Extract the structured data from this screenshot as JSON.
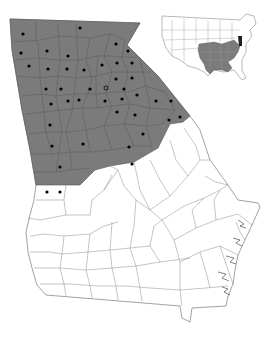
{
  "map": {
    "region": "Georgia",
    "shaded_region_label": "range-north-georgia",
    "colors": {
      "shaded": "#7b7b7b",
      "county_border_shaded": "#555555",
      "county_border_unshaded": "#8a8a8a",
      "background": "#ffffff",
      "dot": "#000000",
      "inset_highlight": "#1e1e1e"
    },
    "state_outline": [
      [
        10,
        19
      ],
      [
        140,
        23
      ],
      [
        127,
        45
      ],
      [
        158,
        76
      ],
      [
        190,
        116
      ],
      [
        183,
        122
      ],
      [
        170,
        124
      ],
      [
        158,
        148
      ],
      [
        134,
        162
      ],
      [
        95,
        170
      ],
      [
        80,
        185
      ],
      [
        36,
        185
      ],
      [
        34,
        200
      ],
      [
        30,
        215
      ],
      [
        26,
        232
      ],
      [
        28,
        252
      ],
      [
        32,
        268
      ],
      [
        37,
        285
      ],
      [
        46,
        295
      ],
      [
        180,
        306
      ],
      [
        182,
        318
      ],
      [
        190,
        322
      ],
      [
        192,
        308
      ],
      [
        226,
        306
      ],
      [
        228,
        296
      ],
      [
        233,
        284
      ],
      [
        235,
        270
      ],
      [
        238,
        255
      ],
      [
        245,
        240
      ],
      [
        252,
        225
      ],
      [
        260,
        207
      ],
      [
        258,
        203
      ],
      [
        238,
        200
      ],
      [
        228,
        185
      ],
      [
        210,
        160
      ],
      [
        200,
        130
      ],
      [
        190,
        116
      ]
    ],
    "shaded_outline": [
      [
        10,
        19
      ],
      [
        140,
        23
      ],
      [
        127,
        45
      ],
      [
        158,
        76
      ],
      [
        190,
        116
      ],
      [
        183,
        122
      ],
      [
        170,
        124
      ],
      [
        158,
        148
      ],
      [
        134,
        162
      ],
      [
        95,
        170
      ],
      [
        80,
        185
      ],
      [
        36,
        185
      ],
      [
        30,
        150
      ],
      [
        22,
        110
      ],
      [
        12,
        50
      ]
    ],
    "dots": [
      {
        "x": 23,
        "y": 34
      },
      {
        "x": 80,
        "y": 28
      },
      {
        "x": 21,
        "y": 53
      },
      {
        "x": 47,
        "y": 51
      },
      {
        "x": 68,
        "y": 56
      },
      {
        "x": 116,
        "y": 44
      },
      {
        "x": 128,
        "y": 51
      },
      {
        "x": 29,
        "y": 66
      },
      {
        "x": 48,
        "y": 69
      },
      {
        "x": 67,
        "y": 69
      },
      {
        "x": 84,
        "y": 70
      },
      {
        "x": 102,
        "y": 65
      },
      {
        "x": 117,
        "y": 63
      },
      {
        "x": 132,
        "y": 63
      },
      {
        "x": 116,
        "y": 79
      },
      {
        "x": 132,
        "y": 78
      },
      {
        "x": 46,
        "y": 89
      },
      {
        "x": 61,
        "y": 89
      },
      {
        "x": 90,
        "y": 89
      },
      {
        "x": 124,
        "y": 89
      },
      {
        "x": 51,
        "y": 104
      },
      {
        "x": 68,
        "y": 101
      },
      {
        "x": 79,
        "y": 100
      },
      {
        "x": 105,
        "y": 101
      },
      {
        "x": 122,
        "y": 99
      },
      {
        "x": 137,
        "y": 95
      },
      {
        "x": 156,
        "y": 101
      },
      {
        "x": 171,
        "y": 101
      },
      {
        "x": 117,
        "y": 112
      },
      {
        "x": 135,
        "y": 115
      },
      {
        "x": 180,
        "y": 117
      },
      {
        "x": 169,
        "y": 120
      },
      {
        "x": 50,
        "y": 125
      },
      {
        "x": 143,
        "y": 134
      },
      {
        "x": 52,
        "y": 146
      },
      {
        "x": 83,
        "y": 144
      },
      {
        "x": 129,
        "y": 147
      },
      {
        "x": 60,
        "y": 167
      },
      {
        "x": 132,
        "y": 164
      },
      {
        "x": 47,
        "y": 192
      },
      {
        "x": 60,
        "y": 192
      }
    ],
    "open_dot": {
      "x": 106,
      "y": 88
    }
  },
  "inset": {
    "title": "United States inset",
    "shaded_states": [
      "Missouri",
      "Arkansas",
      "Louisiana",
      "Mississippi",
      "Tennessee",
      "Alabama",
      "Georgia",
      "Kentucky",
      "South Carolina",
      "North Carolina",
      "Virginia",
      "Texas-east"
    ],
    "highlight_states": [
      "Maryland",
      "Delaware"
    ]
  }
}
